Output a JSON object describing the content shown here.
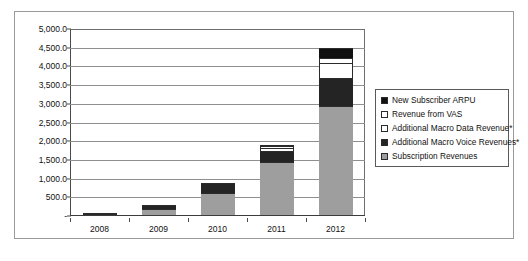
{
  "chart_data": {
    "type": "bar",
    "subtype": "stacked-column",
    "title": "",
    "xlabel": "",
    "ylabel": "",
    "categories": [
      "2008",
      "2009",
      "2010",
      "2011",
      "2012"
    ],
    "ylim": [
      0,
      5000
    ],
    "ytick_step": 500,
    "ytick_labels": [
      "5,000.0",
      "4,500.0",
      "4,000.0",
      "3,500.0",
      "3,000.0",
      "2,500.0",
      "2,000.0",
      "1,500.0",
      "1,000.0",
      "500.0",
      "-"
    ],
    "ytick_values": [
      5000,
      4500,
      4000,
      3500,
      3000,
      2500,
      2000,
      1500,
      1000,
      500,
      0
    ],
    "grid": true,
    "grid_axis": "y",
    "legend_position": "right",
    "series": [
      {
        "name": "Subscription Revenues",
        "color": "#9e9e9e",
        "values": [
          50,
          190,
          610,
          1450,
          2950
        ]
      },
      {
        "name": "Additional Macro Voice Revenues*",
        "color": "#242424",
        "values": [
          15,
          110,
          270,
          280,
          750
        ]
      },
      {
        "name": "Additional Macro Data Revenue*",
        "color": "#ffffff",
        "values": [
          0,
          0,
          0,
          90,
          380
        ]
      },
      {
        "name": "Revenue from VAS",
        "color": "#ffffff",
        "values": [
          0,
          0,
          0,
          40,
          150
        ]
      },
      {
        "name": "New Subscriber ARPU",
        "color": "#111111",
        "values": [
          0,
          0,
          0,
          40,
          270
        ]
      }
    ],
    "totals": [
      65,
      300,
      880,
      1900,
      4500
    ],
    "legend_entries": [
      {
        "label": "New Subscriber ARPU",
        "swatch": "#111111",
        "icon": "legend-swatch-filled"
      },
      {
        "label": "Revenue from VAS",
        "swatch": "#ffffff",
        "icon": "legend-swatch-open"
      },
      {
        "label": "Additional Macro Data Revenue*",
        "swatch": "#ffffff",
        "icon": "legend-swatch-open"
      },
      {
        "label": "Additional Macro Voice Revenues*",
        "swatch": "#242424",
        "icon": "legend-swatch-filled"
      },
      {
        "label": "Subscription Revenues",
        "swatch": "#9e9e9e",
        "icon": "legend-swatch-gray"
      }
    ]
  }
}
